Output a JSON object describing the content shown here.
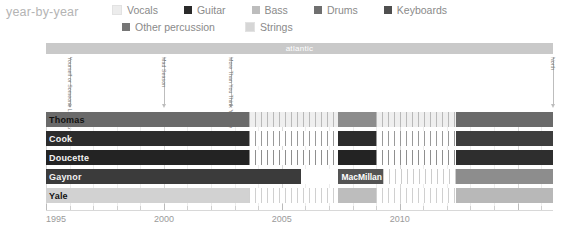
{
  "header": {
    "title": "year-by-year"
  },
  "legend": {
    "rows": [
      [
        {
          "label": "Vocals",
          "color": "#ececec",
          "icon": "legend-swatch"
        },
        {
          "label": "Guitar",
          "color": "#2a2a2a",
          "icon": "legend-swatch"
        },
        {
          "label": "Bass",
          "color": "#bdbdbd",
          "icon": "legend-swatch"
        },
        {
          "label": "Drums",
          "color": "#6f6f6f",
          "icon": "legend-swatch"
        },
        {
          "label": "Keyboards",
          "color": "#4f4f4f",
          "icon": "legend-swatch"
        }
      ],
      [
        {
          "label": "Other percussion",
          "color": "#767676",
          "icon": "legend-swatch"
        },
        {
          "label": "Strings",
          "color": "#d6d6d6",
          "icon": "legend-swatch"
        }
      ]
    ]
  },
  "label_bars": [
    {
      "text": "atlantic",
      "start_year": 1995.0,
      "end_year": 2016.5,
      "color": "#c9c9c9"
    }
  ],
  "annotations": [
    {
      "text": "Yourself or Someone Like You",
      "year": 1996.0
    },
    {
      "text": "Mad Season",
      "year": 2000.0
    },
    {
      "text": "More Than You Think You Are",
      "year": 2002.85
    },
    {
      "text": "North",
      "year": 2016.5
    }
  ],
  "rows": [
    {
      "name": "Thomas",
      "label_color": "dark",
      "base_color": "#e9e9e9",
      "segments": [
        {
          "start": 1995.0,
          "end": 2003.6,
          "color": "#6a6a6a"
        },
        {
          "start": 2003.6,
          "end": 2007.4,
          "color": "#efefef",
          "pattern": "stripes",
          "stripe_color": "#b9b9b9"
        },
        {
          "start": 2007.4,
          "end": 2009.0,
          "color": "#8c8c8c"
        },
        {
          "start": 2009.0,
          "end": 2012.4,
          "color": "#efefef",
          "pattern": "stripes",
          "stripe_color": "#b9b9b9"
        },
        {
          "start": 2012.4,
          "end": 2016.5,
          "color": "#6a6a6a"
        }
      ]
    },
    {
      "name": "Cook",
      "label_color": "light",
      "base_color": "#e9e9e9",
      "segments": [
        {
          "start": 1995.0,
          "end": 2003.6,
          "color": "#2c2c2c"
        },
        {
          "start": 2003.6,
          "end": 2007.4,
          "color": "#ffffff",
          "pattern": "stripes",
          "stripe_color": "#9a9a9a"
        },
        {
          "start": 2007.4,
          "end": 2009.0,
          "color": "#2c2c2c"
        },
        {
          "start": 2009.0,
          "end": 2012.4,
          "color": "#ffffff",
          "pattern": "stripes",
          "stripe_color": "#9a9a9a"
        },
        {
          "start": 2012.4,
          "end": 2016.5,
          "color": "#3e3e3e"
        }
      ]
    },
    {
      "name": "Doucette",
      "label_color": "light",
      "base_color": "#e9e9e9",
      "segments": [
        {
          "start": 1995.0,
          "end": 2003.6,
          "color": "#232323"
        },
        {
          "start": 2003.6,
          "end": 2007.4,
          "color": "#ffffff",
          "pattern": "stripes",
          "stripe_color": "#8f8f8f"
        },
        {
          "start": 2007.4,
          "end": 2009.0,
          "color": "#232323"
        },
        {
          "start": 2009.0,
          "end": 2012.4,
          "color": "#ffffff",
          "pattern": "stripes",
          "stripe_color": "#8f8f8f"
        },
        {
          "start": 2012.4,
          "end": 2016.5,
          "color": "#2e2e2e"
        }
      ]
    },
    {
      "name": "Gaynor",
      "label_color": "light",
      "base_color": "#ffffff",
      "segments": [
        {
          "start": 1995.0,
          "end": 2005.8,
          "color": "#3b3b3b"
        },
        {
          "start": 2007.4,
          "end": 2009.3,
          "color": "#545454",
          "inline_label": "MacMillan"
        },
        {
          "start": 2009.3,
          "end": 2012.4,
          "color": "#ffffff",
          "pattern": "stripes",
          "stripe_color": "#cccccc"
        },
        {
          "start": 2012.4,
          "end": 2016.5,
          "color": "#8d8d8d"
        }
      ]
    },
    {
      "name": "Yale",
      "label_color": "dark",
      "base_color": "#ffffff",
      "segments": [
        {
          "start": 1995.0,
          "end": 2003.6,
          "color": "#d2d2d2"
        },
        {
          "start": 2003.6,
          "end": 2007.4,
          "color": "#ffffff",
          "pattern": "stripes",
          "stripe_color": "#d0d0d0"
        },
        {
          "start": 2007.4,
          "end": 2009.0,
          "color": "#bdbdbd"
        },
        {
          "start": 2009.0,
          "end": 2012.4,
          "color": "#ffffff",
          "pattern": "stripes",
          "stripe_color": "#d0d0d0"
        },
        {
          "start": 2012.4,
          "end": 2016.5,
          "color": "#b8b8b8"
        }
      ]
    }
  ],
  "axis": {
    "min_year": 1995,
    "max_year": 2016.5,
    "tick_step": 1,
    "major_labels": [
      {
        "year": 1995,
        "label": "1995"
      },
      {
        "year": 2000,
        "label": "2000"
      },
      {
        "year": 2005,
        "label": "2005"
      },
      {
        "year": 2010,
        "label": "2010"
      }
    ]
  },
  "chart_data": {
    "type": "bar",
    "title": "year-by-year",
    "xlabel": "",
    "ylabel": "",
    "xlim": [
      1995,
      2016.5
    ],
    "grid": true,
    "legend_position": "top",
    "categories": [
      "Thomas",
      "Cook",
      "Doucette",
      "Gaynor",
      "Yale"
    ],
    "legend_entries": [
      "Vocals",
      "Guitar",
      "Bass",
      "Drums",
      "Keyboards",
      "Other percussion",
      "Strings"
    ],
    "tick_labels": [
      "1995",
      "2000",
      "2005",
      "2010"
    ],
    "annotations": [
      "Yourself or Someone Like You",
      "Mad Season",
      "More Than You Think You Are",
      "North"
    ],
    "band_label": "atlantic",
    "inline_labels": [
      "MacMillan"
    ],
    "series": [
      {
        "name": "Thomas",
        "role": "Vocals",
        "active_spans": [
          [
            1995.0,
            2003.6
          ],
          [
            2003.6,
            2007.4
          ],
          [
            2007.4,
            2009.0
          ],
          [
            2009.0,
            2012.4
          ],
          [
            2012.4,
            2016.5
          ]
        ]
      },
      {
        "name": "Cook",
        "role": "Guitar",
        "active_spans": [
          [
            1995.0,
            2003.6
          ],
          [
            2003.6,
            2007.4
          ],
          [
            2007.4,
            2009.0
          ],
          [
            2009.0,
            2012.4
          ],
          [
            2012.4,
            2016.5
          ]
        ]
      },
      {
        "name": "Doucette",
        "role": "Guitar",
        "active_spans": [
          [
            1995.0,
            2003.6
          ],
          [
            2003.6,
            2007.4
          ],
          [
            2007.4,
            2009.0
          ],
          [
            2009.0,
            2012.4
          ],
          [
            2012.4,
            2016.5
          ]
        ]
      },
      {
        "name": "Gaynor",
        "role": "Drums",
        "active_spans": [
          [
            1995.0,
            2005.8
          ],
          [
            2007.4,
            2009.3
          ],
          [
            2009.3,
            2012.4
          ],
          [
            2012.4,
            2016.5
          ]
        ]
      },
      {
        "name": "Yale",
        "role": "Bass",
        "active_spans": [
          [
            1995.0,
            2003.6
          ],
          [
            2003.6,
            2007.4
          ],
          [
            2007.4,
            2009.0
          ],
          [
            2009.0,
            2012.4
          ],
          [
            2012.4,
            2016.5
          ]
        ]
      }
    ]
  }
}
